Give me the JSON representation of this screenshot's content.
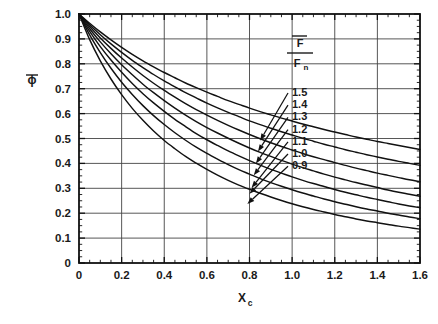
{
  "chart_data": {
    "type": "line",
    "title": "",
    "subtitle": "",
    "xlabel": "X",
    "xlabel_sub": "c",
    "ylabel": "ϕ",
    "ylabel_overbar": true,
    "xlim": [
      0,
      1.6
    ],
    "ylim": [
      0,
      1.0
    ],
    "grid": true,
    "grid_x_step": 0.2,
    "grid_y_step": 0.1,
    "x_ticks": [
      "0",
      "0.2",
      "0.4",
      "0.6",
      "0.8",
      "1.0",
      "1.2",
      "1.4",
      "1.6"
    ],
    "x_tick_values": [
      0,
      0.2,
      0.4,
      0.6,
      0.8,
      1.0,
      1.2,
      1.4,
      1.6
    ],
    "x_minor_step": 0.05,
    "y_ticks": [
      "0",
      "0.1",
      "0.2",
      "0.3",
      "0.4",
      "0.5",
      "0.6",
      "0.7",
      "0.8",
      "0.9",
      "1.0"
    ],
    "y_tick_values": [
      0,
      0.1,
      0.2,
      0.3,
      0.4,
      0.5,
      0.6,
      0.7,
      0.8,
      0.9,
      1.0
    ],
    "y_minor_step": 0.025,
    "legend_position": "inside-upper-right",
    "legend_title_numerator": "F",
    "legend_title_denominator": "F",
    "legend_title_denominator_sub": "n",
    "legend_title_overbar": true,
    "x": [
      0,
      0.05,
      0.1,
      0.15,
      0.2,
      0.25,
      0.3,
      0.35,
      0.4,
      0.45,
      0.5,
      0.55,
      0.6,
      0.65,
      0.7,
      0.75,
      0.8,
      0.85,
      0.9,
      0.95,
      1.0,
      1.05,
      1.1,
      1.15,
      1.2,
      1.25,
      1.3,
      1.35,
      1.4,
      1.45,
      1.5,
      1.55,
      1.6
    ],
    "series": [
      {
        "name": "1.5",
        "label": "1.5",
        "arrow_attach_x": 0.85,
        "arrow_attach_y": 0.492,
        "values": [
          1.0,
          0.963,
          0.928,
          0.896,
          0.866,
          0.838,
          0.812,
          0.788,
          0.765,
          0.744,
          0.723,
          0.704,
          0.686,
          0.669,
          0.652,
          0.637,
          0.622,
          0.608,
          0.595,
          0.582,
          0.57,
          0.558,
          0.547,
          0.536,
          0.526,
          0.516,
          0.506,
          0.497,
          0.488,
          0.48,
          0.472,
          0.464,
          0.456
        ]
      },
      {
        "name": "1.4",
        "label": "1.4",
        "arrow_attach_x": 0.84,
        "arrow_attach_y": 0.448,
        "values": [
          1.0,
          0.957,
          0.917,
          0.88,
          0.846,
          0.814,
          0.785,
          0.757,
          0.731,
          0.707,
          0.684,
          0.663,
          0.642,
          0.623,
          0.605,
          0.588,
          0.571,
          0.556,
          0.541,
          0.527,
          0.514,
          0.501,
          0.489,
          0.477,
          0.466,
          0.455,
          0.445,
          0.435,
          0.426,
          0.417,
          0.408,
          0.4,
          0.392
        ]
      },
      {
        "name": "1.3",
        "label": "1.3",
        "arrow_attach_x": 0.83,
        "arrow_attach_y": 0.4,
        "values": [
          1.0,
          0.95,
          0.904,
          0.862,
          0.823,
          0.787,
          0.753,
          0.722,
          0.693,
          0.666,
          0.64,
          0.616,
          0.594,
          0.573,
          0.553,
          0.534,
          0.516,
          0.499,
          0.483,
          0.468,
          0.454,
          0.44,
          0.427,
          0.415,
          0.403,
          0.392,
          0.381,
          0.371,
          0.361,
          0.352,
          0.343,
          0.334,
          0.326
        ]
      },
      {
        "name": "1.2",
        "label": "1.2",
        "arrow_attach_x": 0.82,
        "arrow_attach_y": 0.352,
        "values": [
          1.0,
          0.941,
          0.888,
          0.84,
          0.796,
          0.756,
          0.718,
          0.684,
          0.652,
          0.622,
          0.594,
          0.568,
          0.544,
          0.522,
          0.501,
          0.481,
          0.462,
          0.444,
          0.428,
          0.412,
          0.397,
          0.383,
          0.37,
          0.357,
          0.345,
          0.334,
          0.323,
          0.313,
          0.303,
          0.293,
          0.284,
          0.276,
          0.268
        ]
      },
      {
        "name": "1.1",
        "label": "1.1",
        "arrow_attach_x": 0.81,
        "arrow_attach_y": 0.302,
        "values": [
          1.0,
          0.93,
          0.869,
          0.815,
          0.766,
          0.721,
          0.68,
          0.643,
          0.609,
          0.577,
          0.548,
          0.52,
          0.495,
          0.472,
          0.45,
          0.43,
          0.411,
          0.393,
          0.376,
          0.361,
          0.346,
          0.332,
          0.319,
          0.307,
          0.295,
          0.284,
          0.274,
          0.264,
          0.255,
          0.246,
          0.237,
          0.229,
          0.222
        ]
      },
      {
        "name": "1.0",
        "label": "1.0",
        "arrow_attach_x": 0.8,
        "arrow_attach_y": 0.278,
        "values": [
          1.0,
          0.916,
          0.845,
          0.782,
          0.726,
          0.677,
          0.632,
          0.592,
          0.556,
          0.523,
          0.493,
          0.465,
          0.44,
          0.417,
          0.395,
          0.375,
          0.357,
          0.339,
          0.323,
          0.308,
          0.294,
          0.281,
          0.269,
          0.257,
          0.246,
          0.236,
          0.226,
          0.217,
          0.209,
          0.2,
          0.193,
          0.185,
          0.178
        ]
      },
      {
        "name": "0.9",
        "label": "0.9",
        "arrow_attach_x": 0.79,
        "arrow_attach_y": 0.237,
        "values": [
          1.0,
          0.897,
          0.812,
          0.739,
          0.676,
          0.621,
          0.573,
          0.53,
          0.492,
          0.459,
          0.428,
          0.401,
          0.376,
          0.353,
          0.332,
          0.313,
          0.296,
          0.28,
          0.265,
          0.251,
          0.238,
          0.226,
          0.215,
          0.205,
          0.195,
          0.186,
          0.177,
          0.169,
          0.162,
          0.155,
          0.148,
          0.142,
          0.136
        ]
      }
    ]
  },
  "colors": {
    "curve": "#111111",
    "axis": "#111111",
    "grid": "#444444",
    "text": "#1a1a1a",
    "background": "#ffffff"
  }
}
